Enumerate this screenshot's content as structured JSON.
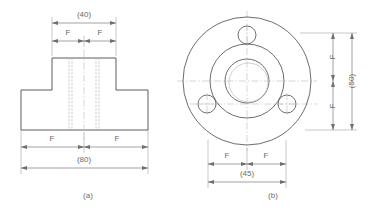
{
  "drawing": {
    "type": "engineering-orthographic-drawing",
    "part": "flanged-hub-boss",
    "background_color": "#ffffff",
    "line_color": "#5c5c5c",
    "hidden_line_color": "#b9b9b9",
    "center_line_color": "#c4c4c4",
    "dimension_color": "#8a8a8a",
    "text_color": "#6b6b6b"
  },
  "views": {
    "front": {
      "caption": "(a)",
      "caption_x": 88,
      "caption_y": 196,
      "description": "front-elevation-t-shaped-section",
      "dimensions": {
        "top_overall": {
          "label": "(40)",
          "text_x": 84,
          "text_y": 15,
          "line_y": 23,
          "x1": 52,
          "x2": 116
        },
        "top_left_half": {
          "label": "F",
          "text_x": 68,
          "text_y": 33,
          "line_y": 41,
          "x1": 52,
          "x2": 84
        },
        "top_right_half": {
          "label": "F",
          "text_x": 100,
          "text_y": 33,
          "line_y": 41,
          "x1": 84,
          "x2": 116
        },
        "bottom_left_half": {
          "label": "F",
          "text_x": 52,
          "text_y": 139,
          "line_y": 147,
          "x1": 21,
          "x2": 84
        },
        "bottom_right_half": {
          "label": "F",
          "text_x": 117,
          "text_y": 139,
          "line_y": 147,
          "x1": 84,
          "x2": 148
        },
        "bottom_overall": {
          "label": "(80)",
          "text_x": 84,
          "text_y": 160,
          "line_y": 168,
          "x1": 21,
          "x2": 148
        }
      },
      "geometry": {
        "base_left": 21,
        "base_right": 148,
        "base_top": 90,
        "base_bottom": 130,
        "boss_left": 52,
        "boss_right": 116,
        "boss_top": 58,
        "centerline_x": 84,
        "hidden_lines_x": [
          69,
          72,
          96,
          99
        ]
      }
    },
    "plan": {
      "caption": "(b)",
      "caption_x": 273,
      "caption_y": 196,
      "description": "plan-view-circular-flange-with-three-bolt-holes",
      "center_x": 247,
      "center_y": 81,
      "circles": {
        "outer_flange_radius": 64,
        "hub_outer_radius": 37,
        "bore_outer_radius": 22,
        "bore_inner_radius": 19,
        "bolt_circle_radius": 46,
        "bolt_hole_radius": 9
      },
      "bolt_holes": [
        {
          "name": "bolt-hole-top",
          "cx": 247,
          "cy": 35
        },
        {
          "name": "bolt-hole-lower-left",
          "cx": 207,
          "cy": 104
        },
        {
          "name": "bolt-hole-lower-right",
          "cx": 287,
          "cy": 104
        }
      ],
      "dimensions": {
        "vertical_upper_half": {
          "label": "F",
          "text_x": 333,
          "text_y": 57,
          "line_x": 333,
          "y1": 33,
          "y2": 81
        },
        "vertical_lower_half": {
          "label": "F",
          "text_x": 333,
          "text_y": 106,
          "line_x": 333,
          "y1": 81,
          "y2": 130
        },
        "vertical_overall": {
          "label": "(50)",
          "text_x": 352,
          "text_y": 81,
          "line_x": 352,
          "y1": 33,
          "y2": 130
        },
        "bottom_left_half": {
          "label": "F",
          "text_x": 227,
          "text_y": 156,
          "line_y": 164,
          "x1": 208,
          "x2": 247
        },
        "bottom_right_half": {
          "label": "F",
          "text_x": 266,
          "text_y": 156,
          "line_y": 164,
          "x1": 247,
          "x2": 286
        },
        "bottom_overall": {
          "label": "(45)",
          "text_x": 247,
          "text_y": 174,
          "line_y": 182,
          "x1": 208,
          "x2": 286
        }
      }
    }
  }
}
